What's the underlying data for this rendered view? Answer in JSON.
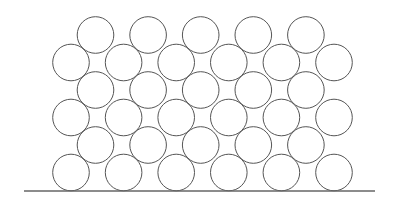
{
  "diagram": {
    "arrangement": "hexagonal",
    "rows": [
      {
        "row": 1,
        "count": 5,
        "offset": "shifted"
      },
      {
        "row": 2,
        "count": 6,
        "offset": "aligned"
      },
      {
        "row": 3,
        "count": 5,
        "offset": "shifted"
      },
      {
        "row": 4,
        "count": 6,
        "offset": "aligned"
      },
      {
        "row": 5,
        "count": 5,
        "offset": "shifted"
      },
      {
        "row": 6,
        "count": 6,
        "offset": "aligned"
      }
    ],
    "total_circles": 33,
    "base_line": true,
    "colors": {
      "stroke": "#555555",
      "base_line": "#666666",
      "background": "#ffffff"
    }
  }
}
